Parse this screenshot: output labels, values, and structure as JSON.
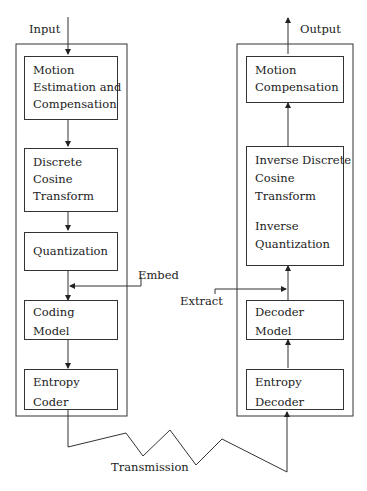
{
  "labels": {
    "input": "Input",
    "output": "Output",
    "embed": "Embed",
    "extract": "Extract",
    "transmission": "Transmission"
  },
  "encoder": {
    "blocks": [
      {
        "lines": [
          "Motion",
          "Estimation and",
          "Compensation"
        ]
      },
      {
        "lines": [
          "Discrete",
          "Cosine",
          "Transform"
        ]
      },
      {
        "lines": [
          "Quantization"
        ]
      },
      {
        "lines": [
          "Coding",
          "Model"
        ]
      },
      {
        "lines": [
          "Entropy",
          "Coder"
        ]
      }
    ]
  },
  "decoder": {
    "blocks": [
      {
        "lines": [
          "Motion",
          "Compensation"
        ]
      },
      {
        "lines": [
          "Inverse Discrete",
          "Cosine",
          "Transform",
          "",
          "Inverse",
          "Quantization"
        ]
      },
      {
        "lines": [
          "Decoder",
          "Model"
        ]
      },
      {
        "lines": [
          "Entropy",
          "Decoder"
        ]
      }
    ]
  }
}
